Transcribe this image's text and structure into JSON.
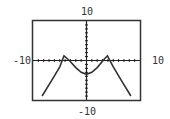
{
  "chart_data": {
    "type": "line",
    "title": "",
    "xlabel": "",
    "ylabel": "",
    "xlim": [
      -10,
      10
    ],
    "ylim": [
      -10,
      10
    ],
    "tick_labels": {
      "x_min": "-10",
      "x_max": "10",
      "y_min": "-10",
      "y_max": "10"
    },
    "grid": false,
    "axes_ticks": true,
    "series": [
      {
        "name": "f(x)",
        "x": [
          -8.3,
          -6.5,
          -5,
          -4.2,
          -3.2,
          -2,
          -1,
          0,
          1,
          2,
          3.1,
          3.9,
          5,
          6.5,
          8.3
        ],
        "y": [
          -9,
          -5,
          -1.6,
          1.2,
          0,
          -1.8,
          -3,
          -3.5,
          -3,
          -1.8,
          0,
          1.2,
          -1.6,
          -5,
          -9
        ]
      }
    ],
    "colors": {
      "frame": "#333333",
      "curve": "#333333",
      "axis": "#222222"
    }
  },
  "labels": {
    "top": "10",
    "bottom": "-10",
    "left": "-10",
    "right": "10"
  }
}
